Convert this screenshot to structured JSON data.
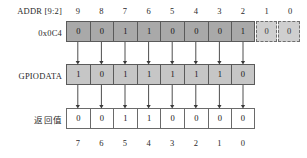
{
  "diagram": {
    "labels": {
      "addr_header": "ADDR [9:2]",
      "addr_value": "0x0C4",
      "gpiodata": "GPIODATA",
      "return_value": "返回值"
    },
    "top_index": [
      "9",
      "8",
      "7",
      "6",
      "5",
      "4",
      "3",
      "2",
      "1",
      "0"
    ],
    "bottom_index": [
      "7",
      "6",
      "5",
      "4",
      "3",
      "2",
      "1",
      "0"
    ],
    "addr_bits": [
      {
        "bit": "9",
        "value": "0",
        "masked": false
      },
      {
        "bit": "8",
        "value": "0",
        "masked": false
      },
      {
        "bit": "7",
        "value": "1",
        "masked": false
      },
      {
        "bit": "6",
        "value": "1",
        "masked": false
      },
      {
        "bit": "5",
        "value": "0",
        "masked": false
      },
      {
        "bit": "4",
        "value": "0",
        "masked": false
      },
      {
        "bit": "3",
        "value": "0",
        "masked": false
      },
      {
        "bit": "2",
        "value": "1",
        "masked": false
      },
      {
        "bit": "1",
        "value": "0",
        "masked": true
      },
      {
        "bit": "0",
        "value": "0",
        "masked": true
      }
    ],
    "gpiodata_bits": [
      {
        "bit": "7",
        "value": "1"
      },
      {
        "bit": "6",
        "value": "0"
      },
      {
        "bit": "5",
        "value": "1"
      },
      {
        "bit": "4",
        "value": "1"
      },
      {
        "bit": "3",
        "value": "1"
      },
      {
        "bit": "2",
        "value": "1"
      },
      {
        "bit": "1",
        "value": "1"
      },
      {
        "bit": "0",
        "value": "0"
      }
    ],
    "return_bits": [
      {
        "bit": "7",
        "value": "0"
      },
      {
        "bit": "6",
        "value": "0"
      },
      {
        "bit": "5",
        "value": "1"
      },
      {
        "bit": "4",
        "value": "1"
      },
      {
        "bit": "3",
        "value": "0"
      },
      {
        "bit": "2",
        "value": "0"
      },
      {
        "bit": "1",
        "value": "0"
      },
      {
        "bit": "0",
        "value": "0"
      }
    ],
    "colors": {
      "addr_cell_fill": "#a9a9a9",
      "addr_masked_fill": "#cfcfcf",
      "gpiodata_cell_fill": "#c6c6c6",
      "return_cell_fill": "#ffffff",
      "border": "#5a5a5a",
      "background": "#ffffff"
    }
  }
}
